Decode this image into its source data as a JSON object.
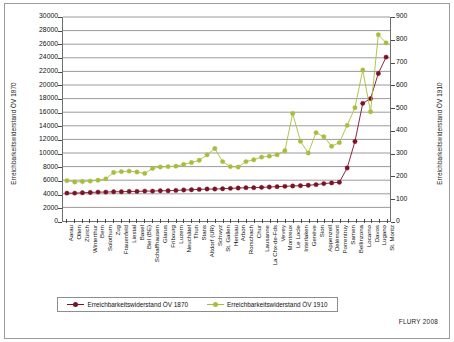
{
  "figure": {
    "credit": "FLURY 2008"
  },
  "legend": {
    "position": "bottom",
    "entries": [
      {
        "label": "Erreichbarkeitswiderstand ÖV 1870",
        "color": "#7B1226"
      },
      {
        "label": "Erreichbarkeitswiderstand ÖV 1910",
        "color": "#A8BD3C"
      }
    ]
  },
  "chart_data": {
    "type": "line",
    "title": "",
    "subtitle": "",
    "xlabel": "",
    "ylabel": "Erreichbarkeitswiderstand ÖV 1870",
    "y2label": "Erreichbarkeitswiderstand ÖV 1910",
    "ylim": [
      0,
      30000
    ],
    "y2lim": [
      0,
      900
    ],
    "yticks": [
      0,
      2000,
      4000,
      6000,
      8000,
      10000,
      12000,
      14000,
      16000,
      18000,
      20000,
      22000,
      24000,
      26000,
      28000,
      30000
    ],
    "y2ticks": [
      0,
      100,
      200,
      300,
      400,
      500,
      600,
      700,
      800,
      900
    ],
    "grid": true,
    "legend_position": "bottom",
    "categories": [
      "Aarau",
      "Olten",
      "Zürich",
      "Winterthur",
      "Bern",
      "Solothurn",
      "Zug",
      "Frauenfeld",
      "Liestal",
      "Basel",
      "Biel (BE)",
      "Schaffhausen",
      "Glarus",
      "Fribourg",
      "Luzern",
      "Neuchâtel",
      "Thun",
      "Stans",
      "Altdorf (UR)",
      "Schwyz",
      "St. Gallen",
      "Herisau",
      "Arbon",
      "Rorschach",
      "Chur",
      "Lausanne",
      "La Chx-de-Fds",
      "Vevey",
      "Montreux",
      "Le Locle",
      "Interlaken",
      "Genève",
      "Sion",
      "Appenzell",
      "Delémont",
      "Porrentruy",
      "Sarnen",
      "Bellinzona",
      "Locarno",
      "Davos",
      "Lugano",
      "St. Moritz"
    ],
    "series": [
      {
        "name": "Erreichbarkeitswiderstand ÖV 1870",
        "color": "#7B1226",
        "axis": "left",
        "values": [
          4100,
          4100,
          4150,
          4200,
          4250,
          4250,
          4300,
          4300,
          4350,
          4350,
          4400,
          4400,
          4450,
          4450,
          4500,
          4550,
          4600,
          4650,
          4700,
          4700,
          4750,
          4800,
          4850,
          4900,
          4900,
          4950,
          5000,
          5050,
          5100,
          5150,
          5200,
          5250,
          5350,
          5500,
          5600,
          5700,
          7800,
          11700,
          17300,
          18000,
          21700,
          24100
        ]
      },
      {
        "name": "Erreichbarkeitswiderstand ÖV 1910",
        "color": "#A8BD3C",
        "axis": "right",
        "values": [
          178,
          172,
          174,
          176,
          180,
          186,
          214,
          218,
          220,
          216,
          210,
          232,
          238,
          240,
          242,
          250,
          258,
          268,
          292,
          320,
          262,
          240,
          238,
          262,
          270,
          282,
          286,
          292,
          310,
          474,
          352,
          300,
          390,
          372,
          330,
          346,
          422,
          500,
          666,
          482,
          822,
          786
        ]
      }
    ]
  }
}
